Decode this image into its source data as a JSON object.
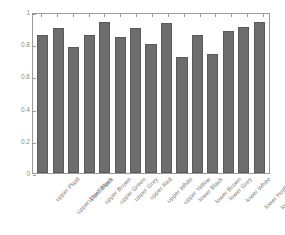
{
  "chart_data": {
    "type": "bar",
    "title": "",
    "xlabel": "",
    "ylabel": "accuracy",
    "ylim": [
      0,
      1
    ],
    "yticks": [
      "0",
      "0.2",
      "0.4",
      "0.6",
      "0.8",
      "1"
    ],
    "grid": false,
    "legend": null,
    "bar_color": "#6d6d6d",
    "categories": [
      "upper Plaid",
      "upper ThinStripes",
      "upper Black",
      "upper Brown",
      "upper Green",
      "upper Grey",
      "upper Red",
      "upper White",
      "upper Yellow",
      "lower Black",
      "lower Brown",
      "lower Grey",
      "lower White",
      "lower HotPants",
      "lower LongSkirt"
    ],
    "values": [
      0.86,
      0.9,
      0.78,
      0.855,
      0.94,
      0.845,
      0.9,
      0.8,
      0.93,
      0.72,
      0.855,
      0.74,
      0.885,
      0.91,
      0.94
    ]
  }
}
